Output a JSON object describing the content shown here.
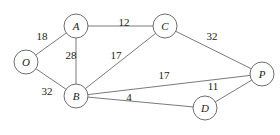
{
  "diagram": {
    "type": "weighted-undirected-graph",
    "colors": {
      "edge": "#7a7a7a",
      "node_stroke": "#6e6e6e",
      "text": "#222222",
      "background": "#ffffff"
    },
    "nodes": [
      {
        "id": "A",
        "label": "A",
        "x": 76,
        "y": 26,
        "r": 12
      },
      {
        "id": "C",
        "label": "C",
        "x": 165,
        "y": 26,
        "r": 12
      },
      {
        "id": "O",
        "label": "O",
        "x": 26,
        "y": 62,
        "r": 12
      },
      {
        "id": "B",
        "label": "B",
        "x": 76,
        "y": 96,
        "r": 12
      },
      {
        "id": "P",
        "label": "P",
        "x": 262,
        "y": 74,
        "r": 12
      },
      {
        "id": "D",
        "label": "D",
        "x": 205,
        "y": 108,
        "r": 12
      }
    ],
    "edges": [
      {
        "from": "O",
        "to": "A",
        "weight": "18",
        "lx": 42,
        "ly": 36
      },
      {
        "from": "O",
        "to": "B",
        "weight": "32",
        "lx": 47,
        "ly": 91
      },
      {
        "from": "A",
        "to": "C",
        "weight": "12",
        "lx": 124,
        "ly": 22
      },
      {
        "from": "A",
        "to": "B",
        "weight": "28",
        "lx": 71,
        "ly": 55
      },
      {
        "from": "B",
        "to": "C",
        "weight": "17",
        "lx": 116,
        "ly": 55
      },
      {
        "from": "C",
        "to": "P",
        "weight": "32",
        "lx": 212,
        "ly": 36
      },
      {
        "from": "B",
        "to": "P",
        "weight": "17",
        "lx": 164,
        "ly": 75
      },
      {
        "from": "B",
        "to": "D",
        "weight": "4",
        "lx": 129,
        "ly": 97
      },
      {
        "from": "D",
        "to": "P",
        "weight": "11",
        "lx": 213,
        "ly": 86
      }
    ]
  }
}
